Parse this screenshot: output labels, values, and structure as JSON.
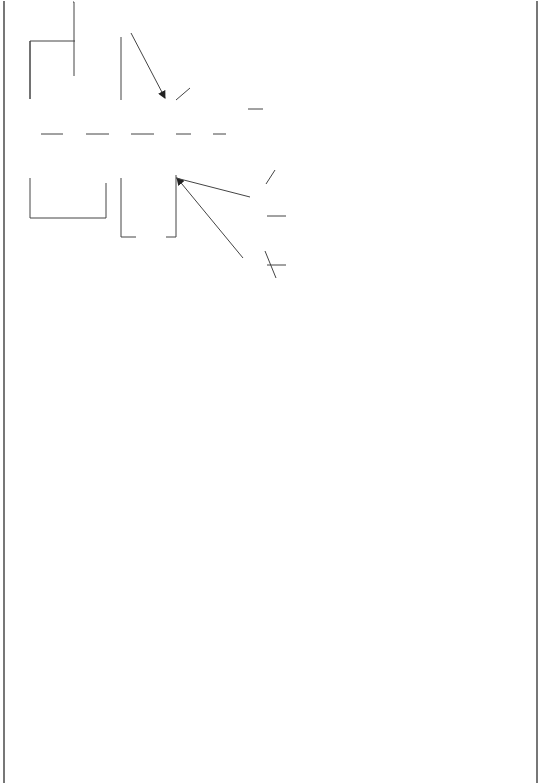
{
  "nodes": {
    "algebra": "Algebra",
    "generalized_arithmetic": "generalized arithmetic",
    "expressions": "expressions",
    "terms": "terms",
    "binomials": "binomials",
    "trinomials": "trinomials",
    "symbols": "symbols",
    "variables": "variables",
    "indices": "indices",
    "operations_top": "operations",
    "powers": "powers",
    "base": "base",
    "index": "index",
    "laws_of_indices": "laws of indices",
    "logarithms": "logarithms",
    "natural": "natural",
    "ln_x": "ln x",
    "characteristic": "characteristic",
    "common": "common",
    "log_x": "log x",
    "mantissa": "mantissa",
    "laws_of_logarithms": "laws of logarithms",
    "numerical_coefficient": "numerical coefficient",
    "manipulated": "manipulated",
    "operations_mid": "operations",
    "arith_ops": "+ ; − ; ÷ ; ×",
    "unlike": "unlike",
    "like": "like",
    "liberal_coefficient": "liberal coefficient",
    "quadratic_eq": "quadratic eq.",
    "quadratic_form": "ax² + bx + c = 0",
    "pure": "Pure",
    "prime": "Prime",
    "factorizable": "Factorizable",
    "square_root": "Square root",
    "completing_square": "completing square",
    "factors": "factors",
    "quadratic_formula": "quadratic formula"
  },
  "links": {
    "is": "is",
    "uses": "uses",
    "involves_ga": "involves",
    "represent": "represent",
    "can_be_symbols": "can be",
    "involves_indices": "involves",
    "on": "on",
    "a_m": "aᵐ",
    "have_base": "have",
    "have_index": "have",
    "governed_by_indices": "governed by",
    "which_are_indices": "which are",
    "can_be_natural": "can be",
    "consists_of": "consists of",
    "can_be_common": "can be",
    "governed_by_logs": "governed by",
    "which_are_logs": "which are",
    "some_are_tri": "some are",
    "consists_of_terms": "consists of",
    "have_3": "have 3",
    "some_are_bi": "some are",
    "have_2": "have 2",
    "are": "are",
    "by": "by",
    "some_are_like": "some are",
    "have_2_or_more": "have 2 or more",
    "different": "different",
    "same": "same",
    "ex_unlike": "3xy and 7ab",
    "ex_like": "3xy and 7xy",
    "can_be_quad": "can be",
    "form": "form",
    "some_are_pure": "some are",
    "some_are_prime": "some are",
    "some_are_fact": "some are",
    "solved_by_pure": "solved by",
    "solved_by_prime": "solved by",
    "not_solved_by": "not solved by",
    "solved_by_fact": "solved by",
    "leads_to": "leads to"
  },
  "equations": {
    "indices_laws": [
      "1. aᵐ, aⁿ = aᵐ⁺ⁿ",
      "2. aᵐ/aⁿ = aᵐ⁻ⁿ",
      "3. (aᵐ)ⁿ = aᵐⁿ"
    ],
    "log_laws": [
      "1. Log AB= LogA + LogB",
      "2. Log A/B = LogA − LogB",
      "3. Log Mⁿ , nLogᵐ"
    ],
    "square_root_example": [
      "4x² = 16",
      "x² = 4",
      "x = ± √4",
      "=) x = ± 2"
    ],
    "factors_example": [
      "x² − 5x + 6 = 0",
      "(x−3) (x−3) = 0",
      "=) x = 3 or x = 2"
    ],
    "formula_example": [
      "x2 + 2x−5 = 0",
      "a = 1, b = 2, c = −5",
      "x = −2 ± √(4−4(1)(−5)) / 2",
      "= −2 ± √24 / 2"
    ]
  },
  "scoring": {
    "title": "Scoring",
    "rows": [
      {
        "label": "Relationships",
        "value": "37x1 = 37"
      },
      {
        "label": "Hierarchy",
        "value": "4x5    = 20"
      },
      {
        "label": "Cross Links",
        "value": "1x10 = 10"
      }
    ],
    "total": "Total: 67"
  }
}
